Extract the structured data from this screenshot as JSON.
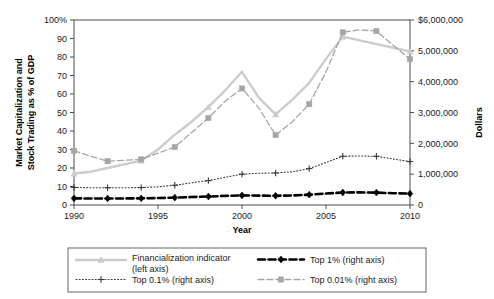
{
  "chart_data": {
    "type": "line",
    "title": "",
    "xlabel": "Year",
    "ylabel": "Market Capitalization and Stock Trading as % of GDP",
    "y2label": "Dollars",
    "x": [
      1990,
      1991,
      1992,
      1993,
      1994,
      1995,
      1996,
      1997,
      1998,
      1999,
      2000,
      2001,
      2002,
      2003,
      2004,
      2005,
      2006,
      2007,
      2008,
      2009,
      2010
    ],
    "xlim": [
      1990,
      2010
    ],
    "xticks": [
      1990,
      1995,
      2000,
      2005,
      2010
    ],
    "xtick_labels": [
      "1990",
      "1995",
      "2000",
      "2005",
      "2010"
    ],
    "ylim": [
      0,
      100
    ],
    "yticks": [
      0,
      10,
      20,
      30,
      40,
      50,
      60,
      70,
      80,
      90,
      100
    ],
    "ytick_labels": [
      "0",
      "10",
      "20",
      "30",
      "40",
      "50",
      "60",
      "70",
      "80",
      "90",
      "100%"
    ],
    "y2lim": [
      0,
      6000000
    ],
    "y2ticks": [
      0,
      1000000,
      2000000,
      3000000,
      4000000,
      5000000,
      6000000
    ],
    "y2tick_labels": [
      "0",
      "1,000,000",
      "2,000,000",
      "3,000,000",
      "4,000,000",
      "5,000,000",
      "6,000,000",
      "$6,000,000"
    ],
    "grid": false,
    "legend_position": "bottom",
    "series": [
      {
        "name": "Financialization indicator (left axis)",
        "axis": "left",
        "color": "#cccccc",
        "line_style": "solid",
        "marker": "triangle",
        "marker_interval": 4,
        "values": [
          17,
          18,
          20,
          22,
          24,
          30,
          38,
          45,
          53,
          62,
          72,
          58,
          49,
          57,
          66,
          79,
          91,
          89,
          87,
          85,
          83
        ]
      },
      {
        "name": "Top 0.01% (right axis)",
        "axis": "right",
        "color": "#a6a6a6",
        "line_style": "dashed",
        "marker": "square",
        "marker_interval": 2,
        "values": [
          1760000,
          1580000,
          1420000,
          1450000,
          1480000,
          1680000,
          1880000,
          2350000,
          2820000,
          3370000,
          3780000,
          3150000,
          2270000,
          2700000,
          3270000,
          4320000,
          5600000,
          5680000,
          5640000,
          5180000,
          4730000
        ]
      },
      {
        "name": "Top 0.1% (right axis)",
        "axis": "right",
        "color": "#3a3a3a",
        "line_style": "dotted",
        "marker": "plus",
        "marker_interval": 2,
        "values": [
          570000,
          560000,
          560000,
          560000,
          565000,
          590000,
          640000,
          720000,
          790000,
          900000,
          1000000,
          1030000,
          1040000,
          1080000,
          1180000,
          1380000,
          1580000,
          1590000,
          1580000,
          1490000,
          1410000
        ]
      },
      {
        "name": "Top 1% (right axis)",
        "axis": "right",
        "color": "#000000",
        "line_style": "dashed-heavy",
        "marker": "diamond",
        "marker_interval": 2,
        "values": [
          215000,
          212000,
          212000,
          213000,
          216000,
          226000,
          240000,
          258000,
          275000,
          295000,
          312000,
          305000,
          300000,
          310000,
          335000,
          372000,
          405000,
          410000,
          402000,
          382000,
          368000
        ]
      }
    ],
    "legend": [
      {
        "label": "Financialization indicator (left axis)",
        "style": "solid-triangle",
        "color": "#cccccc"
      },
      {
        "label": "Top 1% (right axis)",
        "style": "dashed-heavy-diamond",
        "color": "#000000"
      },
      {
        "label": "Top 0.1% (right axis)",
        "style": "dotted-plus",
        "color": "#3a3a3a"
      },
      {
        "label": "Top 0.01% (right axis)",
        "style": "dashed-square",
        "color": "#a6a6a6"
      }
    ]
  },
  "axes": {
    "left_title_line1": "Market Capitalization and",
    "left_title_line2": "Stock Trading as % of GDP",
    "right_title": "Dollars",
    "x_title": "Year"
  },
  "legend_box": {
    "items": [
      {
        "label_line1": "Financialization indicator",
        "label_line2": "(left axis)"
      },
      {
        "label_line1": "Top 1% (right axis)",
        "label_line2": ""
      },
      {
        "label_line1": "Top 0.1% (right axis)",
        "label_line2": ""
      },
      {
        "label_line1": "Top 0.01% (right axis)",
        "label_line2": ""
      }
    ]
  },
  "colors": {
    "financialization": "#cccccc",
    "top001": "#a6a6a6",
    "top01": "#3a3a3a",
    "top1": "#000000",
    "axis": "#4d4d4d",
    "text": "#1a1a1a"
  }
}
